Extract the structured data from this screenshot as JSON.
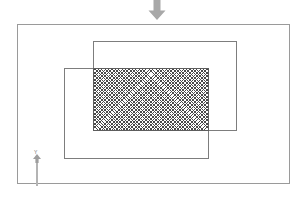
{
  "canvas": {
    "width": 308,
    "height": 198,
    "background_color": "#ffffff"
  },
  "diagram": {
    "outer_boundary": {
      "label": "outer boundary",
      "stroke_color": "#9a9a9a",
      "x": 17,
      "y": 24,
      "width": 273,
      "height": 160
    },
    "rectangles": [
      {
        "name": "rectangle-a",
        "label": "A",
        "stroke_color": "#7d7d7d",
        "fill": "none",
        "x": 93,
        "y": 41,
        "width": 144,
        "height": 90
      },
      {
        "name": "rectangle-b",
        "label": "B",
        "stroke_color": "#7d7d7d",
        "fill": "none",
        "x": 64,
        "y": 68,
        "width": 145,
        "height": 91
      }
    ],
    "intersection": {
      "name": "intersection-region",
      "label": "A ∩ B",
      "fill_pattern": "cross-hatch",
      "hatch_color": "#4a4a4a",
      "stroke_color": "#5d5d5d",
      "x": 93,
      "y": 68,
      "width": 116,
      "height": 63
    },
    "markers": [
      {
        "name": "down-arrow",
        "icon": "arrow-down-icon",
        "color": "#a8a8a8",
        "x": 146,
        "y": 0
      },
      {
        "name": "y-axis-marker",
        "icon": "arrow-up-icon",
        "axis_label": "Y",
        "color": "#b4b4b4",
        "x": 30,
        "y": 150
      }
    ]
  }
}
